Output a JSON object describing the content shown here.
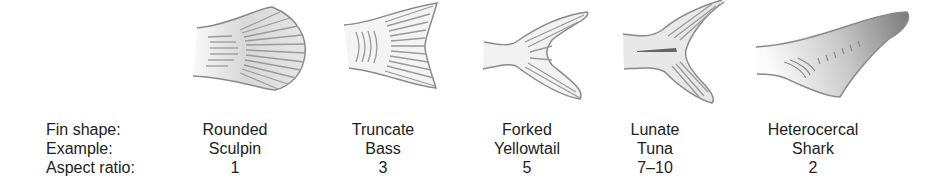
{
  "row_labels": {
    "fin_shape": "Fin shape:",
    "example": "Example:",
    "aspect_ratio": "Aspect ratio:"
  },
  "fins": [
    {
      "shape": "Rounded",
      "example": "Sculpin",
      "aspect_ratio": "1",
      "icon": "rounded-fin-icon"
    },
    {
      "shape": "Truncate",
      "example": "Bass",
      "aspect_ratio": "3",
      "icon": "truncate-fin-icon"
    },
    {
      "shape": "Forked",
      "example": "Yellowtail",
      "aspect_ratio": "5",
      "icon": "forked-fin-icon"
    },
    {
      "shape": "Lunate",
      "example": "Tuna",
      "aspect_ratio": "7–10",
      "icon": "lunate-fin-icon"
    },
    {
      "shape": "Heterocercal",
      "example": "Shark",
      "aspect_ratio": "2",
      "icon": "heterocercal-fin-icon"
    }
  ],
  "colors": {
    "outline": "#8a8a8a",
    "fill_light": "#f0f0f0",
    "ray": "#999999",
    "dark": "#666666"
  }
}
